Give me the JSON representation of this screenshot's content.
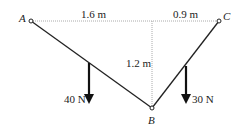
{
  "diagram": {
    "points": {
      "A": {
        "label": "A"
      },
      "B": {
        "label": "B"
      },
      "C": {
        "label": "C"
      }
    },
    "dimensions": {
      "horizontal_left": "1.6 m",
      "horizontal_right": "0.9 m",
      "vertical": "1.2 m"
    },
    "loads": [
      {
        "label": "40 N",
        "segment": "AB"
      },
      {
        "label": "30 N",
        "segment": "BC"
      }
    ],
    "colors": {
      "line": "#222222",
      "dotted": "#aaaaaa"
    }
  }
}
